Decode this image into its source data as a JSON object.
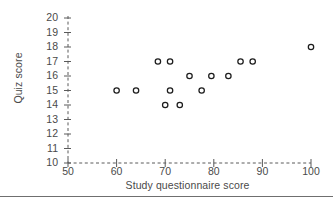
{
  "chart_data": {
    "type": "scatter",
    "title": "",
    "xlabel": "Study questionnaire score",
    "ylabel": "Quiz score",
    "xlim": [
      50,
      100
    ],
    "ylim": [
      10,
      20
    ],
    "xticks": [
      50,
      60,
      70,
      80,
      90,
      100
    ],
    "yticks": [
      10,
      11,
      12,
      13,
      14,
      15,
      16,
      17,
      18,
      19,
      20
    ],
    "xtick_labels": [
      "50",
      "60",
      "70",
      "80",
      "90",
      "100"
    ],
    "ytick_labels": [
      "10",
      "11",
      "12",
      "13",
      "14",
      "15",
      "16",
      "17",
      "18",
      "19",
      "20"
    ],
    "grid": false,
    "legend": null,
    "marker": "open-circle",
    "marker_edge_color": "#1d1d1d",
    "marker_face_color": "#ffffff",
    "axis_style": "dashed",
    "points": [
      {
        "x": 60.0,
        "y": 15
      },
      {
        "x": 64.0,
        "y": 15
      },
      {
        "x": 68.5,
        "y": 17
      },
      {
        "x": 71.0,
        "y": 17
      },
      {
        "x": 70.0,
        "y": 14
      },
      {
        "x": 71.0,
        "y": 15
      },
      {
        "x": 73.0,
        "y": 14
      },
      {
        "x": 75.0,
        "y": 16
      },
      {
        "x": 77.5,
        "y": 15
      },
      {
        "x": 79.5,
        "y": 16
      },
      {
        "x": 83.0,
        "y": 16
      },
      {
        "x": 85.5,
        "y": 17
      },
      {
        "x": 88.0,
        "y": 17
      },
      {
        "x": 100.0,
        "y": 18
      }
    ]
  }
}
